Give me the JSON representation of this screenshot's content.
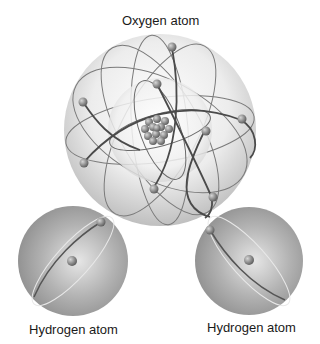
{
  "diagram": {
    "labels": {
      "oxygen": "Oxygen atom",
      "hydrogen_left": "Hydrogen atom",
      "hydrogen_right": "Hydrogen atom"
    },
    "atoms": [
      {
        "name": "oxygen",
        "center": [
          160,
          130
        ],
        "radius": 96,
        "inner_shell_radius": 50,
        "nucleons": 16,
        "electrons": 8
      },
      {
        "name": "hydrogen-left",
        "center": [
          73,
          261
        ],
        "radius": 55,
        "electrons": 1
      },
      {
        "name": "hydrogen-right",
        "center": [
          249,
          261
        ],
        "radius": 54,
        "electrons": 1
      }
    ],
    "colors": {
      "sphere_light": "#f4f4f4",
      "sphere_mid": "#cfcfcf",
      "hydrogen_fill": "#9a9a9a",
      "orbit": "#6a6a6a",
      "electron": "#8a8a8a",
      "text": "#1a1a1a"
    }
  }
}
